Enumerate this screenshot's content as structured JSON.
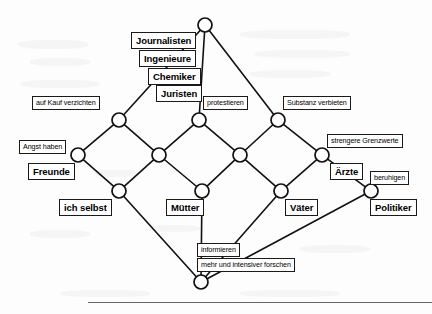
{
  "diagram": {
    "type": "concept-lattice",
    "language": "de",
    "title": "",
    "node_count": 16,
    "node_style": {
      "shape": "circle",
      "radius": 7,
      "stroke": "#111111",
      "fill": "#ffffff"
    },
    "edge_style": {
      "stroke": "#111111",
      "width": 1.6
    },
    "nodes": [
      {
        "id": "top",
        "x": 205,
        "y": 25,
        "label_group": "top-attributes"
      },
      {
        "id": "u1",
        "x": 119,
        "y": 120,
        "label_group": "auf-kauf-verzichten"
      },
      {
        "id": "u2",
        "x": 199,
        "y": 120,
        "label_group": "protestieren"
      },
      {
        "id": "u3",
        "x": 278,
        "y": 120,
        "label_group": "substanz-verbieten"
      },
      {
        "id": "m1",
        "x": 78,
        "y": 155,
        "label_group": "angst-haben-freunde"
      },
      {
        "id": "m2",
        "x": 159,
        "y": 155,
        "label_group": ""
      },
      {
        "id": "m3",
        "x": 240,
        "y": 155,
        "label_group": ""
      },
      {
        "id": "m4",
        "x": 322,
        "y": 155,
        "label_group": "strengere-grenzwerte-aerzte"
      },
      {
        "id": "l1",
        "x": 119,
        "y": 191,
        "label_group": "ich-selbst"
      },
      {
        "id": "l2",
        "x": 202,
        "y": 191,
        "label_group": "muetter"
      },
      {
        "id": "l3",
        "x": 281,
        "y": 191,
        "label_group": "vaeter"
      },
      {
        "id": "l4",
        "x": 371,
        "y": 191,
        "label_group": "beruhigen-politiker"
      },
      {
        "id": "bottom",
        "x": 201,
        "y": 282,
        "label_group": "informieren-forschen"
      }
    ],
    "edges": [
      {
        "from": "top",
        "to": "u1"
      },
      {
        "from": "top",
        "to": "u2"
      },
      {
        "from": "top",
        "to": "u3"
      },
      {
        "from": "u1",
        "to": "m1"
      },
      {
        "from": "u1",
        "to": "m2"
      },
      {
        "from": "u2",
        "to": "m2"
      },
      {
        "from": "u2",
        "to": "m3"
      },
      {
        "from": "u3",
        "to": "m3"
      },
      {
        "from": "u3",
        "to": "m4"
      },
      {
        "from": "m1",
        "to": "l1"
      },
      {
        "from": "m2",
        "to": "l1"
      },
      {
        "from": "m2",
        "to": "l2"
      },
      {
        "from": "m3",
        "to": "l2"
      },
      {
        "from": "m3",
        "to": "l3"
      },
      {
        "from": "m4",
        "to": "l3"
      },
      {
        "from": "m4",
        "to": "l4"
      },
      {
        "from": "l1",
        "to": "bottom"
      },
      {
        "from": "l2",
        "to": "bottom"
      },
      {
        "from": "l3",
        "to": "bottom"
      },
      {
        "from": "l4",
        "to": "bottom"
      }
    ]
  },
  "labels": {
    "journalisten": "Journalisten",
    "ingenieure": "Ingenieure",
    "chemiker": "Chemiker",
    "juristen": "Juristen",
    "auf_kauf_verzichten": "auf Kauf verzichten",
    "protestieren": "protestieren",
    "substanz_verbieten": "Substanz verbieten",
    "angst_haben": "Angst haben",
    "freunde": "Freunde",
    "strengere_grenzwerte": "strengere Grenzwerte",
    "aerzte": "Ärzte",
    "ich_selbst": "ich selbst",
    "muetter": "Mütter",
    "vaeter": "Väter",
    "beruhigen": "beruhigen",
    "politiker": "Politiker",
    "informieren": "informieren",
    "mehr_und_intensiver_forschen": "mehr und intensiver forschen"
  },
  "label_kinds": {
    "objects_bold": [
      "Journalisten",
      "Ingenieure",
      "Chemiker",
      "Juristen",
      "Freunde",
      "Ärzte",
      "ich selbst",
      "Mütter",
      "Väter",
      "Politiker"
    ],
    "attributes_thin": [
      "auf Kauf verzichten",
      "protestieren",
      "Substanz verbieten",
      "Angst haben",
      "strengere Grenzwerte",
      "beruhigen",
      "informieren",
      "mehr und intensiver forschen"
    ]
  },
  "colors": {
    "ink": "#111111",
    "paper": "#ffffff",
    "rule": "#4a4a4a"
  }
}
